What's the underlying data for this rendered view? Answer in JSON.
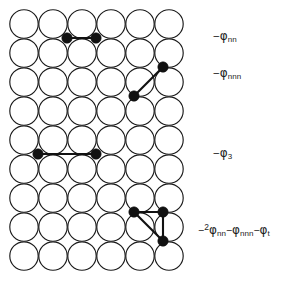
{
  "figure": {
    "background_color": "#ffffff",
    "ink_color": "#111111"
  },
  "lattice": {
    "rows": 9,
    "cols": 6,
    "circle_radius": 14.2,
    "spacing_x": 29.0,
    "spacing_y": 29.0,
    "origin_x": 24.0,
    "origin_y": 24.0,
    "circle_fill": "#ffffff",
    "circle_stroke": "#1a1a1a"
  },
  "annotations": [
    {
      "id": "nn",
      "sign": "−",
      "symbol": "φ",
      "subscript": "nn",
      "text": "−φnn"
    },
    {
      "id": "nnn",
      "sign": "−",
      "symbol": "φ",
      "subscript": "nnn",
      "text": "−φnnn"
    },
    {
      "id": "phi3",
      "sign": "−",
      "symbol": "φ",
      "subscript": "3",
      "text": "−φ3"
    },
    {
      "id": "triangle",
      "sign": "−",
      "coefficient": "2",
      "symbol": "φ",
      "subscript": "nn",
      "term2_sign": "−",
      "term2_symbol": "φ",
      "term2_subscript": "nnn",
      "term3_sign": "−",
      "term3_symbol": "φ",
      "term3_subscript": "t",
      "text": "−2φnn − φnnn − φt"
    }
  ],
  "chart_data": {
    "type": "scatter",
    "xlabel": "",
    "ylabel": "",
    "grid": false,
    "legend_position": "right",
    "categories": [
      "nn",
      "nnn",
      "phi3",
      "triangle"
    ],
    "series": [
      {
        "name": "nn",
        "label": "−φnn",
        "dots": [
          [
            67,
            38
          ],
          [
            96,
            38
          ]
        ],
        "bonds": [
          [
            67,
            38,
            96,
            38
          ]
        ]
      },
      {
        "name": "nnn",
        "label": "−φnnn",
        "dots": [
          [
            163,
            67
          ],
          [
            134,
            96
          ]
        ],
        "bonds": [
          [
            163,
            67,
            134,
            96
          ]
        ]
      },
      {
        "name": "phi3",
        "label": "−φ3",
        "dots": [
          [
            38,
            154
          ],
          [
            96,
            154
          ]
        ],
        "bonds": [
          [
            38,
            154,
            96,
            154
          ]
        ]
      },
      {
        "name": "triangle",
        "label": "−2φnn − φnnn − φt",
        "dots": [
          [
            134,
            212
          ],
          [
            163,
            212
          ],
          [
            163,
            241
          ]
        ],
        "bonds": [
          [
            134,
            212,
            163,
            212
          ],
          [
            163,
            212,
            163,
            241
          ],
          [
            134,
            212,
            163,
            241
          ]
        ]
      }
    ]
  }
}
